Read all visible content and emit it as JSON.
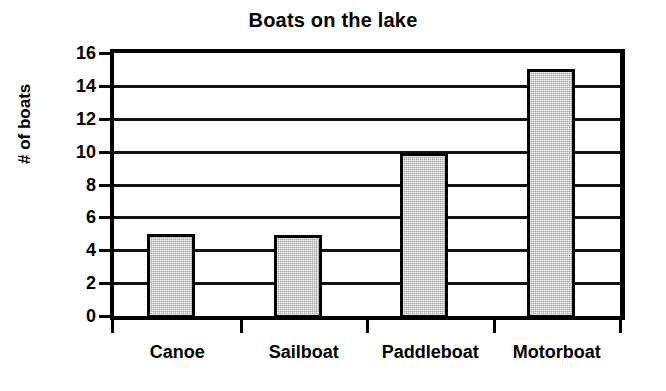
{
  "chart_data": {
    "type": "bar",
    "title": "Boats on the lake",
    "xlabel": "",
    "ylabel": "# of boats",
    "categories": [
      "Canoe",
      "Sailboat",
      "Paddleboat",
      "Motorboat"
    ],
    "values": [
      5,
      4.9,
      9.9,
      15
    ],
    "ylim": [
      0,
      16
    ],
    "ytick_step": 2,
    "yticks": [
      0,
      2,
      4,
      6,
      8,
      10,
      12,
      14,
      16
    ],
    "ytick_labels": [
      "0",
      "2",
      "4",
      "6",
      "8",
      "10",
      "12",
      "14",
      "16"
    ],
    "grid": "horizontal",
    "legend": "none",
    "bar_fill_color": "#a3a3a3",
    "bar_border_color": "#000000",
    "axis_color": "#000000",
    "background_color": "#ffffff"
  }
}
